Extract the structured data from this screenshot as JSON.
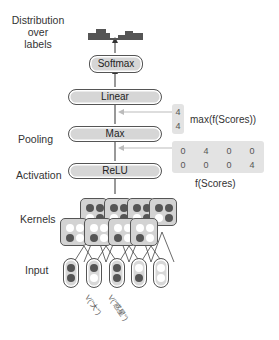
{
  "labels": {
    "distribution": [
      "Distribution",
      "over",
      "labels"
    ],
    "pooling": "Pooling",
    "activation": "Activation",
    "kernels": "Kernels",
    "input": "Input"
  },
  "layers": {
    "softmax": "Softmax",
    "linear": "Linear",
    "max": "Max",
    "relu": "ReLU"
  },
  "max_scores": {
    "values": [
      "4",
      "4"
    ],
    "label": "max(f(Scores))"
  },
  "f_scores": {
    "rows": [
      [
        "0",
        "4",
        "0",
        "0"
      ],
      [
        "0",
        "0",
        "0",
        "4"
      ]
    ],
    "label": "f(Scores)"
  },
  "input_tokens": {
    "annotations": [
      "V(\"大\")",
      "V(\"惑星\")"
    ]
  },
  "colors": {
    "layer_fill": "#d6d6d6",
    "dark_dot": "#555555",
    "light_dot": "#ffffff",
    "score_box": "#e3e3e3",
    "arrow": "#333333",
    "guide_line": "#bbbbbb"
  }
}
